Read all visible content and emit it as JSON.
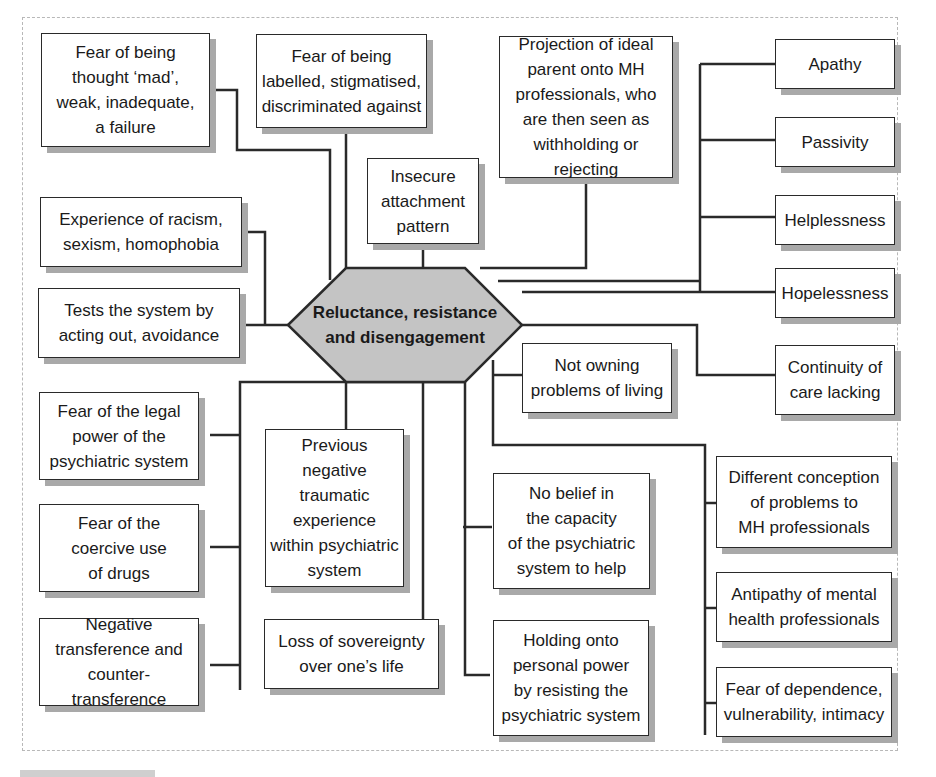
{
  "diagram": {
    "center": {
      "label": "Reluctance, resistance\nand disengagement",
      "fill": "#c4c4c4"
    },
    "nodes": [
      {
        "id": "fear-thought-mad",
        "label": "Fear of being\nthought ‘mad’,\nweak, inadequate,\na failure"
      },
      {
        "id": "fear-labelled",
        "label": "Fear of being\nlabelled, stigmatised,\ndiscriminated against"
      },
      {
        "id": "insecure-attachment",
        "label": "Insecure\nattachment\npattern"
      },
      {
        "id": "projection-ideal-parent",
        "label": "Projection of ideal\nparent onto MH\nprofessionals, who\nare then seen as\nwithholding or rejecting"
      },
      {
        "id": "apathy",
        "label": "Apathy"
      },
      {
        "id": "passivity",
        "label": "Passivity"
      },
      {
        "id": "helplessness",
        "label": "Helplessness"
      },
      {
        "id": "hopelessness",
        "label": "Hopelessness"
      },
      {
        "id": "continuity-care",
        "label": "Continuity of\ncare lacking"
      },
      {
        "id": "experience-racism",
        "label": "Experience of racism,\nsexism, homophobia"
      },
      {
        "id": "tests-system",
        "label": "Tests the system by\nacting out, avoidance"
      },
      {
        "id": "not-owning",
        "label": "Not owning\nproblems of living"
      },
      {
        "id": "fear-legal-power",
        "label": "Fear of the legal\npower of the\npsychiatric system"
      },
      {
        "id": "fear-coercive-drugs",
        "label": "Fear of the\ncoercive use\nof drugs"
      },
      {
        "id": "negative-transference",
        "label": "Negative\ntransference and\ncounter-transference"
      },
      {
        "id": "previous-negative",
        "label": "Previous\nnegative\ntraumatic\nexperience\nwithin psychiatric\nsystem"
      },
      {
        "id": "loss-sovereignty",
        "label": "Loss of sovereignty\nover one’s life"
      },
      {
        "id": "no-belief",
        "label": "No belief in\nthe capacity\nof the psychiatric\nsystem to help"
      },
      {
        "id": "holding-power",
        "label": "Holding onto\npersonal power\nby resisting the\npsychiatric system"
      },
      {
        "id": "different-conception",
        "label": "Different conception\nof problems to\nMH professionals"
      },
      {
        "id": "antipathy",
        "label": "Antipathy of mental\nhealth professionals"
      },
      {
        "id": "fear-dependence",
        "label": "Fear of dependence,\nvulnerability, intimacy"
      }
    ],
    "colors": {
      "line": "#2a2a2a",
      "shadow": "#a9a9a9",
      "border": "#b8b8b8"
    }
  }
}
